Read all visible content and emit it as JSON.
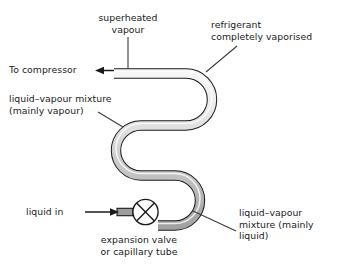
{
  "diagram": {
    "type": "process-flow-diagram",
    "colors": {
      "outline": "#1a1a1a",
      "pipe_vapour_fill": "#f2f2f2",
      "pipe_mixture_fill": "#cfcfcf",
      "pipe_liquid_fill": "#a8a8a8",
      "leader_line": "#3c3c3c",
      "background": "#ffffff",
      "text": "#1a1a1a"
    },
    "labels": {
      "superheated_vapour": "superheated\nvapour",
      "refrigerant_vaporised": "refrigerant\ncompletely vaporised",
      "to_compressor": "To compressor",
      "mixture_mainly_vapour": "liquid–vapour mixture\n(mainly vapour)",
      "liquid_in": "liquid in",
      "expansion_valve": "expansion valve\nor capillary tube",
      "mixture_mainly_liquid": "liquid–vapour\nmixture (mainly\nliquid)"
    },
    "components": {
      "expansion_valve_symbol": "circle-with-cross",
      "coil": "serpentine-tube",
      "outlet_arrow": "arrow-left",
      "inlet_arrow": "arrow-right"
    }
  }
}
